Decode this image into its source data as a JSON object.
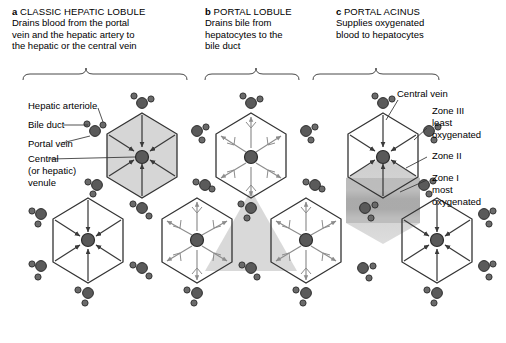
{
  "figure": {
    "type": "diagram",
    "background_color": "#ffffff",
    "stroke_color": "#333333",
    "lobule_fill": "#d9d9d9",
    "portal_lobule_fill": "#dcdcdc",
    "acinus_fill": "#c4c4c4",
    "bile_arrow_color": "#8c8c8c",
    "blood_arrow_color": "#3a3a3a"
  },
  "panels": [
    {
      "letter": "a",
      "title": "CLASSIC HEPATIC LOBULE",
      "description_lines": [
        "Drains blood from the portal",
        "vein and the hepatic artery to",
        "the hepatic or the central vein"
      ]
    },
    {
      "letter": "b",
      "title": "PORTAL LOBULE",
      "description_lines": [
        "Drains bile from",
        "hepatocytes to the",
        "bile duct"
      ]
    },
    {
      "letter": "c",
      "title": "PORTAL ACINUS",
      "description_lines": [
        "Supplies oxygenated",
        "blood to hepatocytes"
      ]
    }
  ],
  "left_labels": [
    {
      "name": "hepatic-arteriole",
      "text": "Hepatic arteriole"
    },
    {
      "name": "bile-duct",
      "text": "Bile duct"
    },
    {
      "name": "portal-vein",
      "text": "Portal vein"
    },
    {
      "name": "central-venule",
      "lines": [
        "Central",
        "(or hepatic)",
        "venule"
      ]
    }
  ],
  "right_labels": [
    {
      "name": "central-vein",
      "text": "Central vein"
    },
    {
      "name": "zone-3",
      "lines": [
        "Zone III",
        "least",
        "oxygenated"
      ]
    },
    {
      "name": "zone-2",
      "lines": [
        "Zone II"
      ]
    },
    {
      "name": "zone-1",
      "lines": [
        "Zone I",
        "most",
        "oxygenated"
      ]
    }
  ],
  "structures": {
    "portal_triad": {
      "label": "portal-triad",
      "components": [
        "hepatic arteriole",
        "bile duct",
        "portal vein"
      ]
    },
    "central_venule": {
      "label": "central-venule"
    }
  }
}
